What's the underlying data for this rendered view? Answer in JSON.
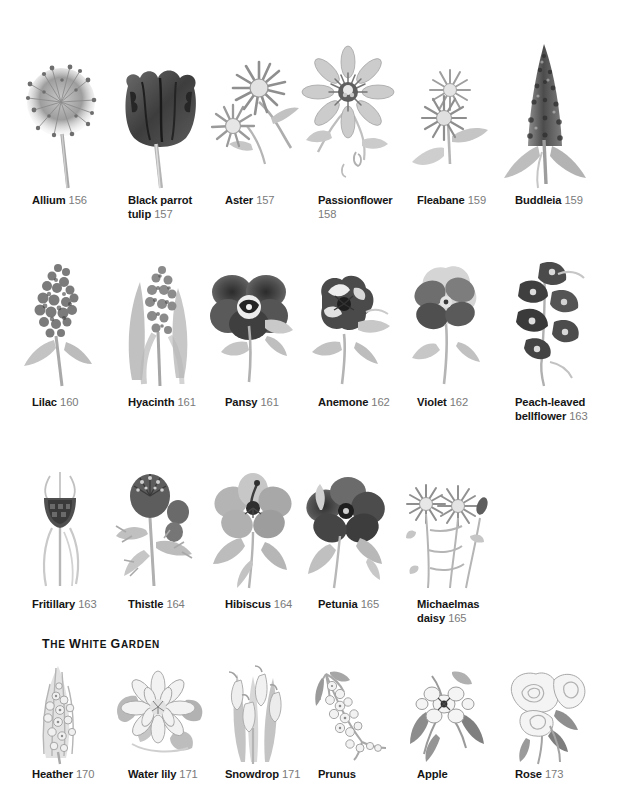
{
  "page": {
    "background": "#ffffff",
    "name_color": "#151515",
    "page_number_color": "#7a7a7a",
    "width": 626,
    "height": 791
  },
  "sections": [
    {
      "heading": null,
      "rows": [
        {
          "items": [
            {
              "name": "Allium",
              "page": "156",
              "art": "allium"
            },
            {
              "name": "Black parrot tulip",
              "page": "157",
              "art": "tulip"
            },
            {
              "name": "Aster",
              "page": "157",
              "art": "aster"
            },
            {
              "name": "Passionflower",
              "page": "158",
              "art": "passionflower"
            },
            {
              "name": "Fleabane",
              "page": "159",
              "art": "fleabane"
            },
            {
              "name": "Buddleia",
              "page": "159",
              "art": "buddleia"
            }
          ]
        },
        {
          "items": [
            {
              "name": "Lilac",
              "page": "160",
              "art": "lilac"
            },
            {
              "name": "Hyacinth",
              "page": "161",
              "art": "hyacinth"
            },
            {
              "name": "Pansy",
              "page": "161",
              "art": "pansy"
            },
            {
              "name": "Anemone",
              "page": "162",
              "art": "anemone"
            },
            {
              "name": "Violet",
              "page": "162",
              "art": "violet"
            },
            {
              "name": "Peach-leaved bellflower",
              "page": "163",
              "art": "bellflower"
            }
          ]
        },
        {
          "items": [
            {
              "name": "Fritillary",
              "page": "163",
              "art": "fritillary"
            },
            {
              "name": "Thistle",
              "page": "164",
              "art": "thistle"
            },
            {
              "name": "Hibiscus",
              "page": "164",
              "art": "hibiscus"
            },
            {
              "name": "Petunia",
              "page": "165",
              "art": "petunia"
            },
            {
              "name": "Michaelmas daisy",
              "page": "165",
              "art": "michaelmas"
            }
          ]
        }
      ]
    },
    {
      "heading": "The white garden",
      "heading_display": [
        {
          "t": "T",
          "caps": true
        },
        {
          "t": "HE",
          "caps": false
        },
        {
          "t": " ",
          "caps": false
        },
        {
          "t": "W",
          "caps": true
        },
        {
          "t": "HITE",
          "caps": false
        },
        {
          "t": " ",
          "caps": false
        },
        {
          "t": "G",
          "caps": true
        },
        {
          "t": "ARDEN",
          "caps": false
        }
      ],
      "rows": [
        {
          "items": [
            {
              "name": "Heather",
              "page": "170",
              "art": "heather"
            },
            {
              "name": "Water lily",
              "page": "171",
              "art": "waterlily"
            },
            {
              "name": "Snowdrop",
              "page": "171",
              "art": "snowdrop"
            },
            {
              "name": "Prunus",
              "page": "",
              "art": "prunus"
            },
            {
              "name": "Apple",
              "page": "",
              "art": "apple"
            },
            {
              "name": "Rose",
              "page": "173",
              "art": "rose"
            }
          ]
        }
      ]
    }
  ]
}
